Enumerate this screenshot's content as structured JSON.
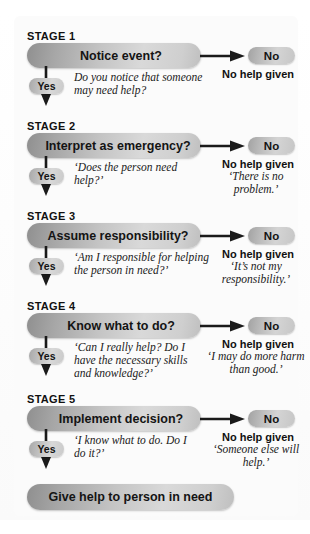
{
  "diagram": {
    "yes_label": "Yes",
    "no_label": "No",
    "no_help_label": "No help given",
    "final": {
      "label": "Give help to person in need"
    },
    "stages": [
      {
        "stage_label": "STAGE 1",
        "question": "Notice event?",
        "yes_note": "Do you notice that someone may need help?",
        "no_label": "No",
        "no_help_label": "No help given",
        "no_quote": ""
      },
      {
        "stage_label": "STAGE 2",
        "question": "Interpret as emergency?",
        "yes_note": "‘Does the person need help?’",
        "no_label": "No",
        "no_help_label": "No help given",
        "no_quote": "‘There is no problem.’"
      },
      {
        "stage_label": "STAGE 3",
        "question": "Assume responsibility?",
        "yes_note": "‘Am I responsible for helping the person in need?’",
        "no_label": "No",
        "no_help_label": "No help given",
        "no_quote": "‘It’s not my responsibility.’"
      },
      {
        "stage_label": "STAGE 4",
        "question": "Know what to do?",
        "yes_note": "‘Can I really help? Do I have the necessary skills and knowledge?’",
        "no_label": "No",
        "no_help_label": "No help given",
        "no_quote": "‘I may do more harm than good.’"
      },
      {
        "stage_label": "STAGE 5",
        "question": "Implement decision?",
        "yes_note": "‘I know what to do. Do I do it?’",
        "no_label": "No",
        "no_help_label": "No help given",
        "no_quote": "‘Someone else will help.’"
      }
    ]
  },
  "colors": {
    "pill_dark": "#8f8f8f",
    "pill_light": "#d9d9d9",
    "text": "#141414",
    "background": "#ffffff",
    "arrow": "#1a1a1a"
  }
}
